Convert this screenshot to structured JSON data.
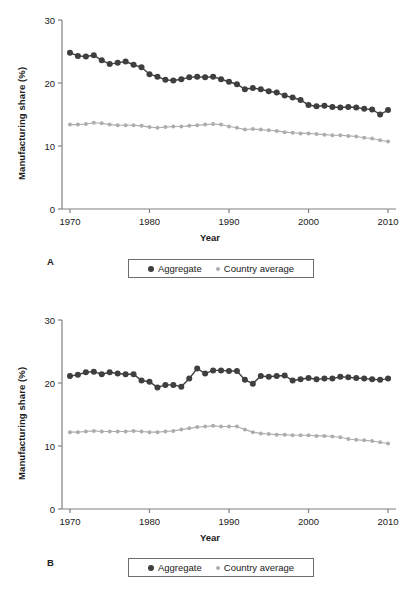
{
  "figure": {
    "panels": [
      {
        "letter": "A",
        "ylabel": "Manufacturing share (%)",
        "xlabel": "Year",
        "legend": {
          "series1": "Aggregate",
          "series2": "Country average"
        }
      },
      {
        "letter": "B",
        "ylabel": "Manufacturing share (%)",
        "xlabel": "Year",
        "legend": {
          "series1": "Aggregate",
          "series2": "Country average"
        }
      }
    ],
    "colors": {
      "aggregate": "#3f3f3f",
      "country_average": "#adadad",
      "axis": "#808080",
      "text": "#1a1a1a"
    },
    "y_ticks": [
      "0",
      "10",
      "20",
      "30"
    ],
    "x_ticks": [
      "1970",
      "1980",
      "1990",
      "2000",
      "2010"
    ]
  },
  "chart_data": [
    {
      "type": "line",
      "panel": "A",
      "title": "",
      "xlabel": "Year",
      "ylabel": "Manufacturing share (%)",
      "xlim": [
        1969,
        2011
      ],
      "ylim": [
        0,
        30
      ],
      "yticks": [
        0,
        10,
        20,
        30
      ],
      "xticks": [
        1970,
        1980,
        1990,
        2000,
        2010
      ],
      "grid": false,
      "legend_position": "below-center",
      "x": [
        1970,
        1971,
        1972,
        1973,
        1974,
        1975,
        1976,
        1977,
        1978,
        1979,
        1980,
        1981,
        1982,
        1983,
        1984,
        1985,
        1986,
        1987,
        1988,
        1989,
        1990,
        1991,
        1992,
        1993,
        1994,
        1995,
        1996,
        1997,
        1998,
        1999,
        2000,
        2001,
        2002,
        2003,
        2004,
        2005,
        2006,
        2007,
        2008,
        2009,
        2010
      ],
      "series": [
        {
          "name": "Aggregate",
          "color": "#3f3f3f",
          "values": [
            24.8,
            24.3,
            24.2,
            24.4,
            23.6,
            23.0,
            23.2,
            23.4,
            22.9,
            22.5,
            21.4,
            21.0,
            20.5,
            20.4,
            20.6,
            20.9,
            21.0,
            20.9,
            21.0,
            20.6,
            20.2,
            19.8,
            19.0,
            19.2,
            19.0,
            18.7,
            18.5,
            18.0,
            17.7,
            17.3,
            16.5,
            16.3,
            16.4,
            16.2,
            16.1,
            16.2,
            16.1,
            15.9,
            15.8,
            15.0,
            15.7
          ]
        },
        {
          "name": "Country average",
          "color": "#adadad",
          "values": [
            13.4,
            13.4,
            13.5,
            13.7,
            13.6,
            13.4,
            13.3,
            13.3,
            13.3,
            13.2,
            13.0,
            12.9,
            13.0,
            13.1,
            13.1,
            13.2,
            13.3,
            13.4,
            13.5,
            13.4,
            13.1,
            12.9,
            12.6,
            12.7,
            12.6,
            12.5,
            12.4,
            12.2,
            12.1,
            12.0,
            12.0,
            11.9,
            11.8,
            11.7,
            11.7,
            11.6,
            11.5,
            11.3,
            11.2,
            10.9,
            10.7
          ]
        }
      ]
    },
    {
      "type": "line",
      "panel": "B",
      "title": "",
      "xlabel": "Year",
      "ylabel": "Manufacturing share (%)",
      "xlim": [
        1969,
        2011
      ],
      "ylim": [
        0,
        30
      ],
      "yticks": [
        0,
        10,
        20,
        30
      ],
      "xticks": [
        1970,
        1980,
        1990,
        2000,
        2010
      ],
      "grid": false,
      "legend_position": "below-center",
      "x": [
        1970,
        1971,
        1972,
        1973,
        1974,
        1975,
        1976,
        1977,
        1978,
        1979,
        1980,
        1981,
        1982,
        1983,
        1984,
        1985,
        1986,
        1987,
        1988,
        1989,
        1990,
        1991,
        1992,
        1993,
        1994,
        1995,
        1996,
        1997,
        1998,
        1999,
        2000,
        2001,
        2002,
        2003,
        2004,
        2005,
        2006,
        2007,
        2008,
        2009,
        2010
      ],
      "series": [
        {
          "name": "Aggregate",
          "color": "#3f3f3f",
          "values": [
            21.1,
            21.3,
            21.7,
            21.8,
            21.4,
            21.7,
            21.5,
            21.4,
            21.4,
            20.4,
            20.2,
            19.3,
            19.7,
            19.7,
            19.4,
            20.7,
            22.3,
            21.5,
            22.0,
            22.0,
            21.9,
            21.9,
            20.5,
            19.9,
            21.1,
            21.0,
            21.1,
            21.2,
            20.4,
            20.6,
            20.8,
            20.6,
            20.7,
            20.7,
            21.0,
            20.9,
            20.8,
            20.7,
            20.6,
            20.5,
            20.7
          ]
        },
        {
          "name": "Country average",
          "color": "#adadad",
          "values": [
            12.2,
            12.2,
            12.3,
            12.4,
            12.3,
            12.3,
            12.3,
            12.3,
            12.4,
            12.3,
            12.2,
            12.2,
            12.3,
            12.4,
            12.6,
            12.8,
            13.0,
            13.1,
            13.2,
            13.1,
            13.1,
            13.1,
            12.6,
            12.2,
            12.0,
            11.9,
            11.8,
            11.8,
            11.7,
            11.7,
            11.7,
            11.6,
            11.6,
            11.5,
            11.4,
            11.1,
            11.0,
            10.9,
            10.8,
            10.6,
            10.4
          ]
        }
      ]
    }
  ]
}
